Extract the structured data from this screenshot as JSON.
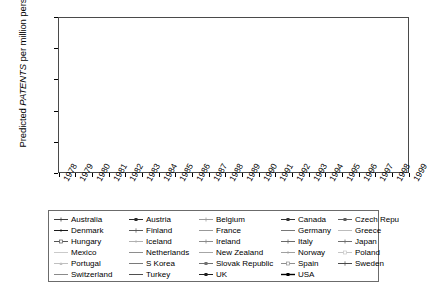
{
  "axis": {
    "y_title_prefix": "Predicted ",
    "y_title_italic": "PATENTS",
    "y_title_suffix": " per million persons",
    "y_ticks": [
      "0",
      "50",
      "100",
      "150",
      "200",
      "250"
    ],
    "x_ticks": [
      "1978",
      "1979",
      "1980",
      "1981",
      "1982",
      "1983",
      "1984",
      "1985",
      "1986",
      "1987",
      "1988",
      "1989",
      "1990",
      "1991",
      "1992",
      "1993",
      "1994",
      "1995",
      "1996",
      "1997",
      "1998",
      "1999"
    ]
  },
  "legend": {
    "columns": 5,
    "entries": [
      "Australia",
      "Austria",
      "Belgium",
      "Canada",
      "Czech Republic",
      "Denmark",
      "Finland",
      "France",
      "Germany",
      "Greece",
      "Hungary",
      "Iceland",
      "Ireland",
      "Italy",
      "Japan",
      "Mexico",
      "Netherlands",
      "New Zealand",
      "Norway",
      "Poland",
      "Portugal",
      "S Korea",
      "Slovak Republic",
      "Spain",
      "Sweden",
      "Switzerland",
      "Turkey",
      "UK",
      "USA"
    ]
  },
  "chart_data": {
    "type": "line",
    "title": "",
    "xlabel": "",
    "ylabel": "Predicted PATENTS per million persons",
    "ylim": [
      0,
      250
    ],
    "ytick_step": 50,
    "grid": true,
    "legend_position": "bottom",
    "x": [
      "1978",
      "1979",
      "1980",
      "1981",
      "1982",
      "1983",
      "1984",
      "1985",
      "1986",
      "1987",
      "1988",
      "1989",
      "1990",
      "1991",
      "1992",
      "1993",
      "1994",
      "1995",
      "1996",
      "1997",
      "1998",
      "1999"
    ],
    "series": [
      {
        "name": "USA",
        "color": "#000000",
        "marker": "square-filled",
        "width": 1.4,
        "values": [
          140,
          148,
          125,
          128,
          133,
          145,
          170,
          188,
          222,
          178,
          184,
          172,
          160,
          152,
          147,
          138,
          152,
          147,
          143,
          182,
          188,
          205
        ]
      },
      {
        "name": "Japan",
        "color": "#6e6e6e",
        "marker": "cross",
        "width": 1.0,
        "values": [
          132,
          133,
          121,
          112,
          100,
          96,
          104,
          110,
          110,
          108,
          133,
          128,
          119,
          117,
          119,
          122,
          128,
          132,
          142,
          162,
          150,
          196
        ]
      },
      {
        "name": "Switzerland",
        "color": "#8a8a8a",
        "marker": "none",
        "width": 1.0,
        "values": [
          63,
          66,
          60,
          62,
          64,
          70,
          80,
          92,
          97,
          103,
          114,
          108,
          100,
          98,
          104,
          110,
          113,
          108,
          117,
          137,
          142,
          190
        ]
      },
      {
        "name": "Sweden",
        "color": "#4a4a4a",
        "marker": "plus",
        "width": 1.0,
        "values": [
          68,
          72,
          70,
          72,
          74,
          80,
          84,
          96,
          101,
          108,
          122,
          112,
          102,
          100,
          108,
          112,
          120,
          114,
          120,
          140,
          142,
          182
        ]
      },
      {
        "name": "Germany",
        "color": "#777777",
        "marker": "none",
        "width": 1.0,
        "values": [
          66,
          69,
          66,
          66,
          68,
          72,
          78,
          88,
          92,
          98,
          106,
          103,
          97,
          94,
          98,
          104,
          108,
          104,
          111,
          128,
          132,
          173
        ]
      },
      {
        "name": "Finland",
        "color": "#5a5a5a",
        "marker": "plus",
        "width": 1.0,
        "values": [
          60,
          62,
          58,
          60,
          62,
          68,
          74,
          82,
          88,
          94,
          100,
          98,
          93,
          90,
          93,
          97,
          100,
          97,
          104,
          119,
          122,
          150
        ]
      },
      {
        "name": "Canada",
        "color": "#333333",
        "marker": "square-filled",
        "width": 1.0,
        "values": [
          54,
          56,
          52,
          53,
          55,
          60,
          66,
          72,
          78,
          84,
          88,
          86,
          81,
          79,
          82,
          86,
          90,
          87,
          93,
          106,
          110,
          122
        ]
      },
      {
        "name": "UK",
        "color": "#202020",
        "marker": "square-filled",
        "width": 1.0,
        "values": [
          52,
          54,
          50,
          51,
          53,
          57,
          62,
          68,
          72,
          78,
          82,
          80,
          76,
          74,
          77,
          80,
          84,
          81,
          86,
          98,
          101,
          112
        ]
      },
      {
        "name": "Netherlands",
        "color": "#8e8e8e",
        "marker": "none",
        "width": 1.0,
        "values": [
          50,
          52,
          49,
          50,
          51,
          55,
          60,
          65,
          70,
          75,
          79,
          77,
          73,
          71,
          74,
          77,
          80,
          78,
          83,
          94,
          97,
          108
        ]
      },
      {
        "name": "France",
        "color": "#999999",
        "marker": "none",
        "width": 1.0,
        "values": [
          48,
          50,
          47,
          48,
          49,
          53,
          57,
          62,
          67,
          72,
          75,
          74,
          70,
          68,
          71,
          74,
          77,
          75,
          80,
          90,
          93,
          103
        ]
      },
      {
        "name": "Austria",
        "color": "#2b2b2b",
        "marker": "square-filled",
        "width": 1.0,
        "values": [
          46,
          47,
          44,
          45,
          47,
          50,
          54,
          59,
          63,
          68,
          71,
          70,
          66,
          64,
          67,
          70,
          73,
          71,
          76,
          85,
          88,
          97
        ]
      },
      {
        "name": "Denmark",
        "color": "#1a1a1a",
        "marker": "diamond-filled",
        "width": 1.0,
        "values": [
          44,
          45,
          43,
          43,
          45,
          48,
          52,
          57,
          61,
          65,
          68,
          67,
          64,
          62,
          64,
          67,
          70,
          68,
          73,
          82,
          85,
          94
        ]
      },
      {
        "name": "Australia",
        "color": "#3d3d3d",
        "marker": "cross",
        "width": 1.0,
        "values": [
          42,
          43,
          41,
          41,
          43,
          46,
          50,
          54,
          58,
          62,
          65,
          64,
          61,
          59,
          61,
          64,
          66,
          65,
          69,
          78,
          80,
          89
        ]
      },
      {
        "name": "Norway",
        "color": "#a0a0a0",
        "marker": "dot",
        "width": 1.0,
        "values": [
          40,
          41,
          39,
          40,
          41,
          44,
          47,
          51,
          55,
          59,
          62,
          61,
          58,
          56,
          58,
          61,
          63,
          62,
          66,
          74,
          76,
          84
        ]
      },
      {
        "name": "Belgium",
        "color": "#9c9c9c",
        "marker": "cross",
        "width": 1.0,
        "values": [
          38,
          39,
          37,
          38,
          39,
          42,
          45,
          49,
          52,
          56,
          59,
          58,
          55,
          53,
          55,
          58,
          60,
          59,
          63,
          70,
          72,
          80
        ]
      },
      {
        "name": "New Zealand",
        "color": "#a6a6a6",
        "marker": "none",
        "width": 1.0,
        "values": [
          36,
          37,
          35,
          36,
          37,
          40,
          43,
          46,
          50,
          53,
          56,
          55,
          52,
          51,
          53,
          55,
          57,
          56,
          60,
          67,
          69,
          76
        ]
      },
      {
        "name": "Italy",
        "color": "#6a6a6a",
        "marker": "cross",
        "width": 1.0,
        "values": [
          34,
          35,
          33,
          34,
          35,
          37,
          40,
          44,
          47,
          50,
          52,
          52,
          49,
          48,
          50,
          52,
          54,
          53,
          56,
          63,
          65,
          72
        ]
      },
      {
        "name": "Ireland",
        "color": "#8b8b8b",
        "marker": "cross",
        "width": 1.0,
        "values": [
          32,
          33,
          31,
          32,
          33,
          35,
          38,
          41,
          44,
          47,
          49,
          49,
          46,
          45,
          47,
          49,
          51,
          50,
          53,
          59,
          61,
          68
        ]
      },
      {
        "name": "Iceland",
        "color": "#b0b0b0",
        "marker": "dot",
        "width": 1.0,
        "values": [
          30,
          31,
          29,
          30,
          31,
          33,
          36,
          39,
          42,
          44,
          47,
          46,
          44,
          43,
          44,
          46,
          48,
          47,
          50,
          56,
          58,
          64
        ]
      },
      {
        "name": "Spain",
        "color": "#8f8f8f",
        "marker": "square-open",
        "width": 1.0,
        "values": [
          28,
          29,
          27,
          28,
          29,
          31,
          33,
          36,
          39,
          41,
          43,
          43,
          41,
          40,
          41,
          43,
          45,
          44,
          47,
          52,
          54,
          60
        ]
      },
      {
        "name": "Czech Republic",
        "color": "#5d5d5d",
        "marker": "square-filled",
        "width": 1.0,
        "values": [
          26,
          27,
          25,
          26,
          27,
          29,
          31,
          34,
          36,
          39,
          41,
          40,
          38,
          37,
          39,
          40,
          42,
          41,
          44,
          49,
          50,
          56
        ]
      },
      {
        "name": "Hungary",
        "color": "#555555",
        "marker": "square-open",
        "width": 1.0,
        "values": [
          24,
          25,
          23,
          24,
          25,
          27,
          29,
          31,
          34,
          36,
          38,
          37,
          36,
          35,
          36,
          38,
          39,
          39,
          41,
          46,
          47,
          52
        ]
      },
      {
        "name": "Slovak Republic",
        "color": "#707070",
        "marker": "square-filled",
        "width": 1.0,
        "values": [
          22,
          23,
          21,
          22,
          23,
          25,
          27,
          29,
          31,
          33,
          35,
          34,
          33,
          32,
          33,
          35,
          36,
          36,
          38,
          42,
          43,
          48
        ]
      },
      {
        "name": "Greece",
        "color": "#bcbcbc",
        "marker": "dash",
        "width": 1.0,
        "values": [
          20,
          21,
          19,
          20,
          21,
          22,
          24,
          26,
          28,
          30,
          32,
          31,
          30,
          29,
          30,
          32,
          33,
          33,
          35,
          39,
          40,
          44
        ]
      },
      {
        "name": "S Korea",
        "color": "#7a7a7a",
        "marker": "dash",
        "width": 1.0,
        "values": [
          18,
          19,
          17,
          18,
          19,
          20,
          22,
          24,
          26,
          28,
          29,
          29,
          27,
          27,
          28,
          29,
          30,
          30,
          32,
          36,
          37,
          41
        ]
      },
      {
        "name": "Portugal",
        "color": "#c0c0c0",
        "marker": "triangle",
        "width": 1.0,
        "values": [
          16,
          17,
          15,
          16,
          17,
          18,
          20,
          21,
          23,
          25,
          26,
          26,
          25,
          24,
          25,
          26,
          27,
          27,
          29,
          32,
          33,
          37
        ]
      },
      {
        "name": "Poland",
        "color": "#c6c6c6",
        "marker": "square-open",
        "width": 1.0,
        "values": [
          14,
          15,
          13,
          14,
          15,
          16,
          17,
          19,
          20,
          22,
          23,
          23,
          22,
          21,
          22,
          23,
          24,
          24,
          26,
          29,
          30,
          33
        ]
      },
      {
        "name": "Mexico",
        "color": "#cacaca",
        "marker": "dash",
        "width": 1.0,
        "values": [
          12,
          12,
          11,
          12,
          12,
          13,
          14,
          16,
          17,
          18,
          19,
          19,
          18,
          18,
          18,
          19,
          20,
          20,
          21,
          24,
          25,
          27
        ]
      },
      {
        "name": "Turkey",
        "color": "#4f4f4f",
        "marker": "none",
        "width": 1.0,
        "values": [
          10,
          10,
          9,
          10,
          10,
          11,
          12,
          13,
          14,
          15,
          16,
          16,
          15,
          15,
          15,
          16,
          17,
          17,
          18,
          20,
          21,
          23
        ]
      }
    ]
  }
}
